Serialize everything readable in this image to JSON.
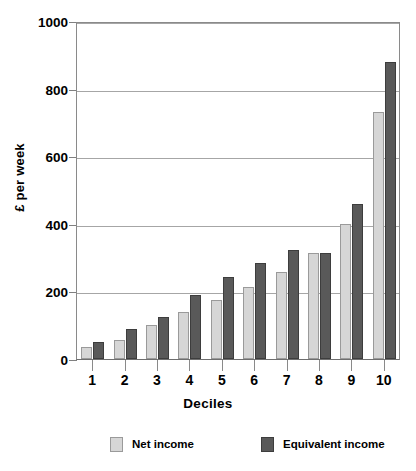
{
  "chart_data": {
    "type": "bar",
    "title": "",
    "xlabel": "Deciles",
    "ylabel": "£ per week",
    "categories": [
      "1",
      "2",
      "3",
      "4",
      "5",
      "6",
      "7",
      "8",
      "9",
      "10"
    ],
    "series": [
      {
        "name": "Net income",
        "color": "#d6d6d6",
        "values": [
          35,
          57,
          100,
          140,
          175,
          212,
          258,
          315,
          399,
          731
        ]
      },
      {
        "name": "Equivalent income",
        "color": "#595959",
        "values": [
          50,
          88,
          124,
          190,
          242,
          285,
          322,
          315,
          458,
          880
        ]
      }
    ],
    "ylim": [
      0,
      1000
    ],
    "yticks": [
      "0",
      "200",
      "400",
      "600",
      "800",
      "1000"
    ],
    "ytick_values": [
      0,
      200,
      400,
      600,
      800,
      1000
    ],
    "grid": "horizontal",
    "legend_position": "bottom"
  },
  "axis": {
    "y_title": "£ per week",
    "x_title": "Deciles"
  },
  "legend": {
    "items": [
      {
        "label": "Net income",
        "swatch": "net"
      },
      {
        "label": "Equivalent income",
        "swatch": "eq"
      }
    ]
  }
}
